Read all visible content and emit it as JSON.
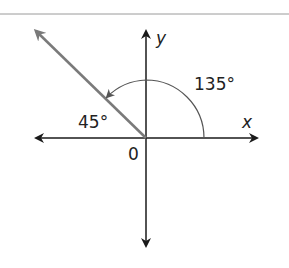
{
  "diagram": {
    "type": "angle-on-coordinate-plane",
    "labels": {
      "y_axis": "y",
      "x_axis": "x",
      "origin": "0",
      "angle_large": "135°",
      "angle_small": "45°"
    },
    "colors": {
      "axes": "#1a1a1a",
      "ray": "#7a7a7a",
      "arc": "#555555",
      "rule": "#9a9a9a"
    },
    "angles_deg": {
      "terminal_side": 135,
      "reference": 45
    }
  }
}
